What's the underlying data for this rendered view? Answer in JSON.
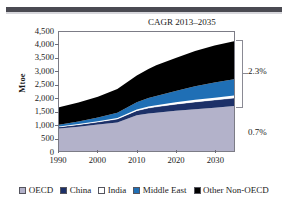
{
  "figure": {
    "top_rule": "horizontal-rule"
  },
  "chart_data": {
    "type": "area",
    "title": "",
    "annotation_title": "CAGR 2013–2035",
    "xlabel": "",
    "ylabel": "Mtoe",
    "ylim": [
      0,
      4500
    ],
    "xlim": [
      1990,
      2035
    ],
    "grid": false,
    "stacked": true,
    "legend_position": "bottom",
    "y_ticks": [
      "0",
      "500",
      "1,000",
      "1,500",
      "2,000",
      "2,500",
      "3,000",
      "3,500",
      "4,000",
      "4,500"
    ],
    "y_tick_values": [
      0,
      500,
      1000,
      1500,
      2000,
      2500,
      3000,
      3500,
      4000,
      4500
    ],
    "x_ticks": [
      "1990",
      "2000",
      "2010",
      "2020",
      "2030"
    ],
    "x_tick_values": [
      1990,
      2000,
      2010,
      2020,
      2030
    ],
    "x": [
      1990,
      1995,
      2000,
      2005,
      2010,
      2013,
      2015,
      2020,
      2025,
      2030,
      2035
    ],
    "series": [
      {
        "name": "OECD",
        "color": "#b3b2ca",
        "values": [
          850,
          920,
          1000,
          1080,
          1350,
          1420,
          1450,
          1520,
          1580,
          1640,
          1700
        ]
      },
      {
        "name": "China",
        "color": "#1c3068",
        "values": [
          60,
          75,
          95,
          130,
          175,
          205,
          220,
          250,
          275,
          290,
          300
        ]
      },
      {
        "name": "India",
        "color": "#ffffff",
        "values": [
          20,
          24,
          30,
          38,
          48,
          55,
          60,
          70,
          80,
          88,
          95
        ]
      },
      {
        "name": "Middle East",
        "color": "#1f6fb5",
        "values": [
          60,
          95,
          140,
          200,
          270,
          320,
          350,
          430,
          510,
          570,
          620
        ]
      },
      {
        "name": "Other Non-OECD",
        "color": "#000000",
        "values": [
          660,
          720,
          790,
          900,
          1010,
          1100,
          1160,
          1250,
          1340,
          1400,
          1440
        ]
      }
    ],
    "annotations": [
      {
        "name": "cagr-non-oecd",
        "text": "2.3%",
        "target": "upper-bracket"
      },
      {
        "name": "cagr-oecd",
        "text": "0.7%",
        "target": "lower-region"
      }
    ]
  },
  "legend": {
    "items": [
      {
        "label": "OECD",
        "color": "#b3b2ca"
      },
      {
        "label": "China",
        "color": "#1c3068"
      },
      {
        "label": "India",
        "color": "#ffffff"
      },
      {
        "label": "Middle East",
        "color": "#1f6fb5"
      },
      {
        "label": "Other Non-OECD",
        "color": "#000000"
      }
    ]
  }
}
